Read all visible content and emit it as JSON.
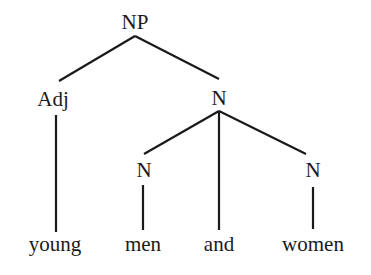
{
  "tree": {
    "root": "NP",
    "nodes": {
      "np": "NP",
      "adj": "Adj",
      "n_top": "N",
      "n_left": "N",
      "n_right": "N"
    },
    "words": {
      "young": "young",
      "men": "men",
      "and": "and",
      "women": "women"
    },
    "line_color": "#1a1a1a"
  }
}
